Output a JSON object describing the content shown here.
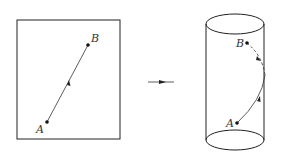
{
  "diagram": {
    "left_panel": {
      "description": "Flat rectangle with a straight line segment from A to B",
      "point_a_label": "A",
      "point_b_label": "B"
    },
    "transform_arrow": {
      "description": "arrow indicating mapping from plane to cylinder"
    },
    "right_panel": {
      "description": "Cylinder with a curved path (helix segment) from A to B",
      "point_a_label": "A",
      "point_b_label": "B"
    },
    "colors": {
      "stroke": "#222222",
      "background": "#ffffff"
    }
  }
}
